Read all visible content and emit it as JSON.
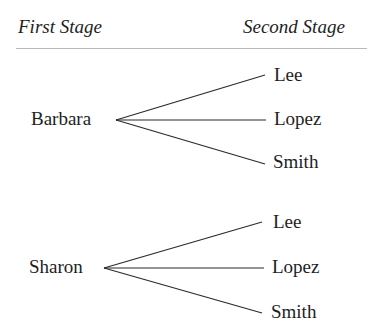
{
  "header": {
    "first_stage": "First Stage",
    "second_stage": "Second Stage"
  },
  "tree": {
    "groups": [
      {
        "root": "Barbara",
        "branches": [
          "Lee",
          "Lopez",
          "Smith"
        ]
      },
      {
        "root": "Sharon",
        "branches": [
          "Lee",
          "Lopez",
          "Smith"
        ]
      }
    ]
  },
  "colors": {
    "text": "#1e1e1e",
    "line": "#2a2a2a",
    "rule": "#b9b9b9",
    "background": "#ffffff"
  }
}
